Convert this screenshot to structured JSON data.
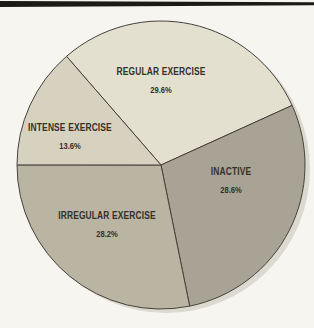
{
  "page": {
    "background_color": "#f7f5ef",
    "top_bar_color": "#1b1a17",
    "text_color": "#34312b"
  },
  "chart_data": {
    "type": "pie",
    "title": "",
    "legend": "none",
    "labels_inside_slices": true,
    "slices": [
      {
        "label": "REGULAR EXERCISE",
        "value": 29.6,
        "pct_label": "29.6%",
        "color": "#e4e0d0"
      },
      {
        "label": "INACTIVE",
        "value": 28.6,
        "pct_label": "28.6%",
        "color": "#a9a396"
      },
      {
        "label": "IRREGULAR EXERCISE",
        "value": 28.2,
        "pct_label": "28.2%",
        "color": "#bab4a3"
      },
      {
        "label": "INTENSE EXERCISE",
        "value": 13.6,
        "pct_label": "13.6%",
        "color": "#d7d2c0"
      }
    ],
    "layout": {
      "start_angle_deg": -41,
      "clockwise": true,
      "center": [
        161,
        165
      ],
      "radius": 144,
      "outline_color": "#45423c",
      "shadow_color": "#dcd9d0",
      "shadow_offset": [
        5,
        4
      ]
    }
  }
}
